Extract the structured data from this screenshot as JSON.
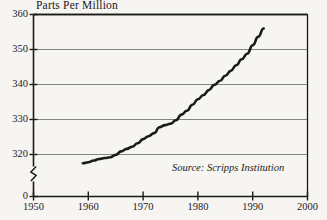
{
  "chart_data": {
    "type": "line",
    "title": "Parts Per Million",
    "xlabel": "",
    "ylabel": "Parts Per Million",
    "source_note": "Source: Scripps Institution",
    "grid": true,
    "legend": "none",
    "xlim": [
      1950,
      2000
    ],
    "ylim": [
      315,
      360
    ],
    "y_axis_break": true,
    "y_axis_break_symbol": "zigzag",
    "yticks": [
      0,
      320,
      330,
      340,
      350,
      360
    ],
    "ytick_labels": [
      "0",
      "320",
      "330",
      "340",
      "350",
      "360"
    ],
    "xticks": [
      1950,
      1960,
      1970,
      1980,
      1990,
      2000
    ],
    "xtick_labels": [
      "1950",
      "1960",
      "1970",
      "1980",
      "1990",
      "2000"
    ],
    "series": [
      {
        "name": "Atmospheric CO2 concentration",
        "color": "#1a1a1a",
        "x": [
          1959,
          1960,
          1961,
          1962,
          1963,
          1964,
          1965,
          1966,
          1967,
          1968,
          1969,
          1970,
          1971,
          1972,
          1973,
          1974,
          1975,
          1976,
          1977,
          1978,
          1979,
          1980,
          1981,
          1982,
          1983,
          1984,
          1985,
          1986,
          1987,
          1988,
          1989,
          1990,
          1991,
          1992
        ],
        "values": [
          317.5,
          317.8,
          318.3,
          318.7,
          319.0,
          319.2,
          319.9,
          320.9,
          321.6,
          322.2,
          323.2,
          324.4,
          325.2,
          326.1,
          327.8,
          328.4,
          328.8,
          329.8,
          331.4,
          332.5,
          334.2,
          335.8,
          337.0,
          338.4,
          339.9,
          341.0,
          342.5,
          343.9,
          345.5,
          347.2,
          348.8,
          351.2,
          353.6,
          356.0
        ]
      }
    ]
  },
  "figure": {
    "title": "Parts Per Million",
    "source": "Source: Scripps Institution"
  }
}
